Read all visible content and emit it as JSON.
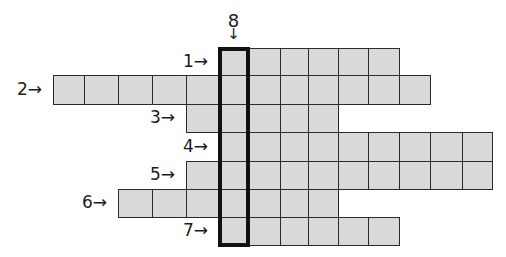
{
  "puzzle": {
    "type": "crossword",
    "cell_fill": "#d9d9d9",
    "border_color": "#2a2a2a",
    "highlight_border_color": "#111111",
    "column_edges": [
      53,
      84,
      118,
      152,
      186,
      219,
      248,
      280,
      308,
      338,
      368,
      399,
      430,
      462,
      492
    ],
    "row_edges": [
      48,
      75,
      104,
      132,
      161,
      189,
      217,
      245
    ],
    "across": [
      {
        "number": "1",
        "label": "1→",
        "row": 0,
        "start_col": 5,
        "length": 6
      },
      {
        "number": "2",
        "label": "2→",
        "row": 1,
        "start_col": 0,
        "length": 12
      },
      {
        "number": "3",
        "label": "3→",
        "row": 2,
        "start_col": 4,
        "length": 5
      },
      {
        "number": "4",
        "label": "4→",
        "row": 3,
        "start_col": 5,
        "length": 9
      },
      {
        "number": "5",
        "label": "5→",
        "row": 4,
        "start_col": 4,
        "length": 10
      },
      {
        "number": "6",
        "label": "6→",
        "row": 5,
        "start_col": 2,
        "length": 7
      },
      {
        "number": "7",
        "label": "7→",
        "row": 6,
        "start_col": 5,
        "length": 6
      }
    ],
    "down": [
      {
        "number": "8",
        "label": "8",
        "arrow": "↓",
        "col": 5,
        "start_row": 0,
        "length": 7,
        "highlighted": true
      }
    ]
  }
}
